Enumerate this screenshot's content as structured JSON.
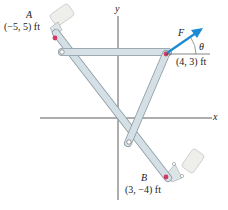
{
  "axes": {
    "x_label": "x",
    "y_label": "y"
  },
  "points": {
    "A": {
      "label": "A",
      "coords": "(−5, 5) ft"
    },
    "B": {
      "label": "B",
      "coords": "(3, −4) ft"
    },
    "C": {
      "coords": "(4, 3) ft"
    }
  },
  "force": {
    "label": "F",
    "angle_label": "θ"
  },
  "colors": {
    "member_fill": "#d4e0e6",
    "member_stroke": "#8a9aa2",
    "pin_red": "#d23a63",
    "force_arrow": "#1a8ad4",
    "support_block": "#eeeeea",
    "axis": "#333333"
  }
}
